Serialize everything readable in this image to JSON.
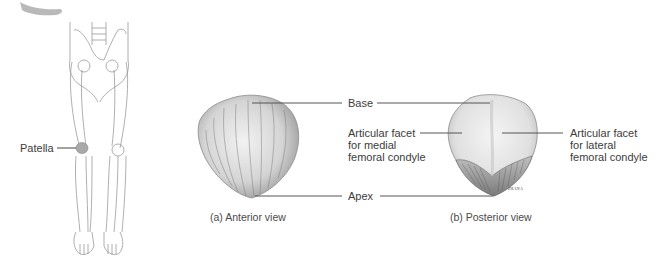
{
  "figure": {
    "skeleton": {
      "label": "Patella"
    },
    "anterior": {
      "caption": "(a) Anterior view"
    },
    "posterior": {
      "caption": "(b) Posterior view",
      "signature": "DIANA"
    },
    "labels": {
      "base": "Base",
      "apex": "Apex",
      "medial_facet": "Articular facet\nfor medial\nfemoral condyle",
      "lateral_facet": "Articular facet\nfor lateral\nfemoral condyle"
    },
    "colors": {
      "bone_light": "#eeeeee",
      "bone_mid": "#c8c8c8",
      "bone_dark": "#8a8a8a",
      "leader_line": "#555555",
      "skeleton_line": "#9a9a9a"
    }
  }
}
